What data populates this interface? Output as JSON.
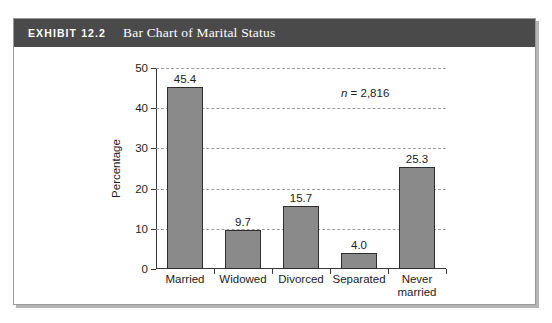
{
  "exhibit": {
    "tag": "EXHIBIT 12.2",
    "title": "Bar Chart of Marital Status"
  },
  "chart_data": {
    "type": "bar",
    "title": "Bar Chart of Marital Status",
    "categories": [
      "Married",
      "Widowed",
      "Divorced",
      "Separated",
      "Never married"
    ],
    "category_lines": [
      [
        "Married"
      ],
      [
        "Widowed"
      ],
      [
        "Divorced"
      ],
      [
        "Separated"
      ],
      [
        "Never",
        "married"
      ]
    ],
    "values": [
      45.4,
      9.7,
      15.7,
      4.0,
      25.3
    ],
    "value_labels": [
      "45.4",
      "9.7",
      "15.7",
      "4.0",
      "25.3"
    ],
    "xlabel": "",
    "ylabel": "Percentage",
    "ylim": [
      0,
      50
    ],
    "yticks": [
      0,
      10,
      20,
      30,
      40,
      50
    ],
    "ytick_labels": [
      "0",
      "10",
      "20",
      "30",
      "40",
      "50"
    ],
    "grid": "horizontal-dashed",
    "legend": "none",
    "bar_color": "#8a8a8a",
    "bar_edge_color": "#2e2e2e",
    "annotations": [
      {
        "name": "sample-size",
        "italic_part": "n",
        "rest": " = 2,816",
        "text": "n = 2,816"
      }
    ]
  }
}
